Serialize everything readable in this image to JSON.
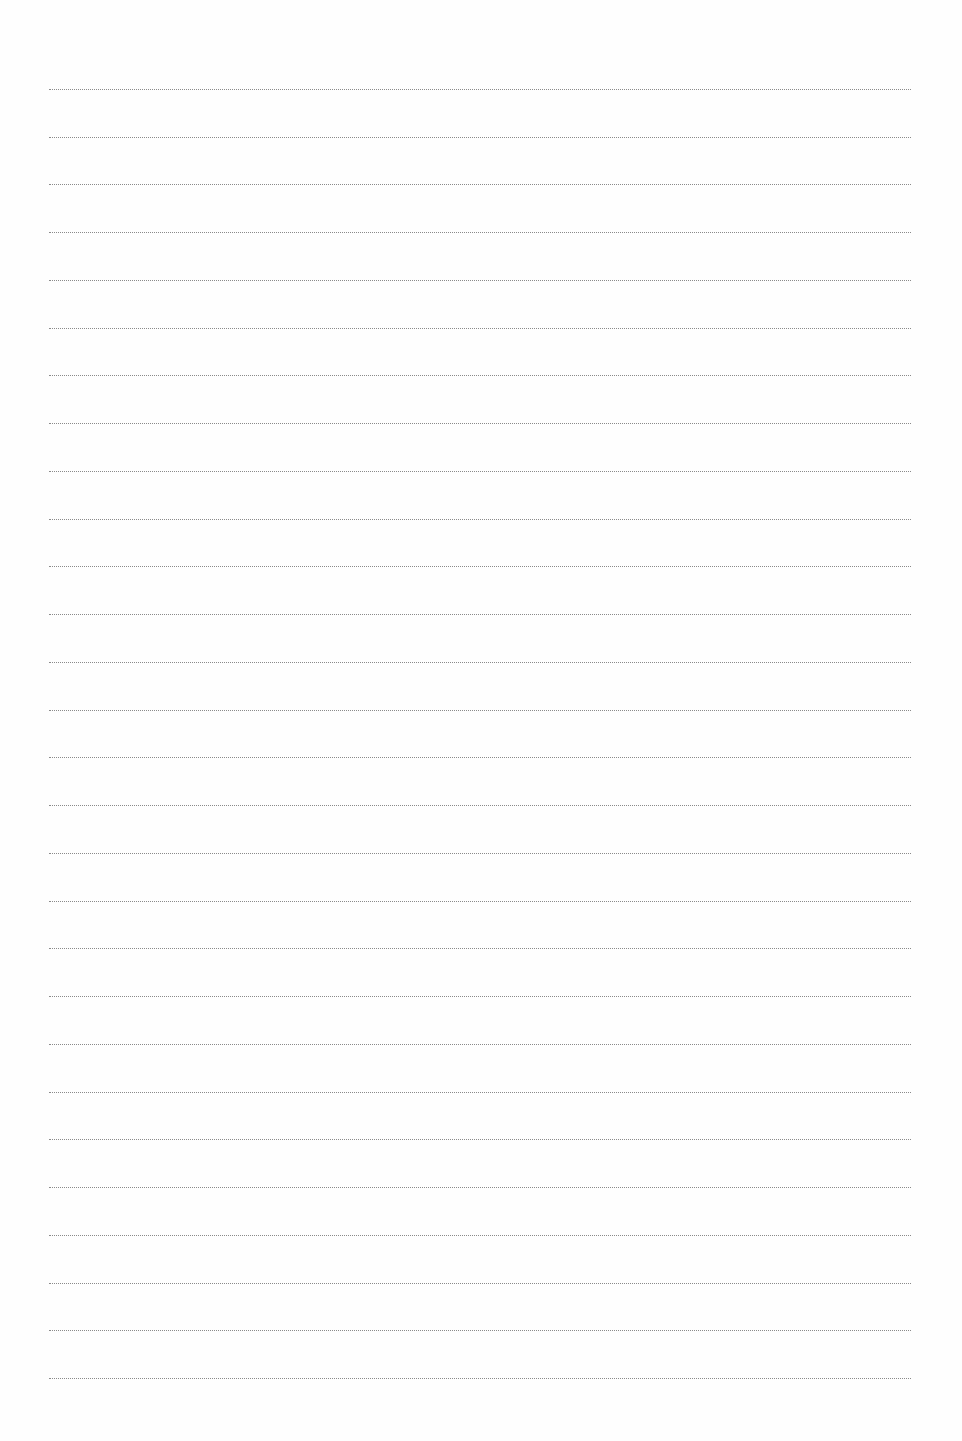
{
  "page": {
    "type": "blank-lined-paper",
    "background": "#fefefe",
    "line_color": "#8a8a8a",
    "line_style": "dotted",
    "line_count": 28,
    "first_line_y": 89,
    "line_spacing": 47.74,
    "line_left": 49,
    "line_right": 911
  }
}
